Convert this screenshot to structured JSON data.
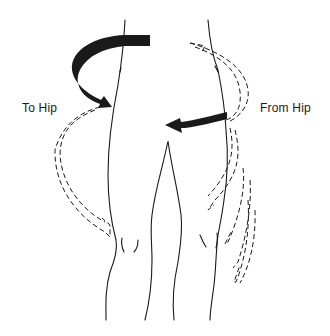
{
  "diagram": {
    "labels": {
      "to_hip": "To Hip",
      "from_hip": "From Hip"
    },
    "arrows": [
      {
        "name": "to-hip-solid-arrow",
        "style": "solid",
        "direction": "toward body (right)",
        "side": "left"
      },
      {
        "name": "from-hip-solid-arrow",
        "style": "solid",
        "direction": "toward midline (left)",
        "side": "right"
      },
      {
        "name": "to-hip-dashed-path",
        "style": "dashed",
        "side": "left"
      },
      {
        "name": "from-hip-dashed-paths",
        "style": "dashed",
        "side": "right",
        "count": 4
      }
    ],
    "colors": {
      "line": "#1a1a1a",
      "background": "#ffffff"
    }
  }
}
